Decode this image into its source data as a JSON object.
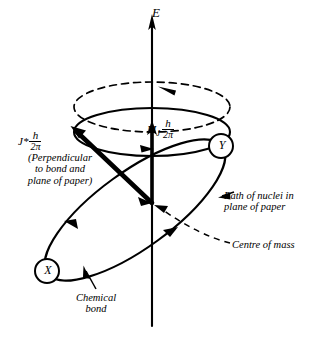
{
  "figure": {
    "type": "scientific-line-diagram",
    "background_color": "#ffffff",
    "ink_color": "#000000",
    "width": 316,
    "height": 340
  },
  "axis": {
    "label": "E",
    "name": "energy-field-axis",
    "orientation": "vertical",
    "arrow_at": "top",
    "x": 152,
    "top_y": 18,
    "bottom_y": 326
  },
  "vectors": {
    "total_angular_momentum": {
      "symbol": "J*",
      "numerator": "h",
      "denominator": "2π",
      "note": "(Perpendicular to bond and plane of paper)",
      "note_lines": [
        "(Perpendicular",
        "to bond and",
        "plane of paper)"
      ],
      "from": [
        152,
        203
      ],
      "to": [
        72,
        128
      ],
      "style": "thick-solid-arrow"
    },
    "projection": {
      "symbol": "M",
      "subscript": "J",
      "numerator": "h",
      "denominator": "2π",
      "from": [
        152,
        203
      ],
      "to": [
        152,
        124
      ],
      "style": "thick-solid-arrow"
    }
  },
  "precession": {
    "dashed_circle_label": "precession-path",
    "center": [
      152,
      107
    ],
    "rx": 78,
    "ry": 25,
    "arrow_direction": "counterclockwise",
    "cone_base_label": "cone-base-ellipse",
    "cone_base_center": [
      152,
      132
    ],
    "cone_base_rx": 78,
    "cone_base_ry": 24
  },
  "orbit": {
    "label": "Path of nuclei in plane of paper",
    "label_lines": [
      "Path of nuclei in",
      "plane of paper"
    ],
    "tilt_deg": -36,
    "center": [
      135,
      210
    ],
    "rx": 108,
    "ry": 38,
    "arrows": 3
  },
  "nuclei": [
    {
      "name": "nucleus-x",
      "letter": "X",
      "cx": 47,
      "cy": 271,
      "r": 12
    },
    {
      "name": "nucleus-y",
      "letter": "Y",
      "cx": 221,
      "cy": 146,
      "r": 12
    }
  ],
  "annotations": {
    "centre_of_mass": {
      "text": "Centre of mass",
      "leader": "dashed",
      "points_to": [
        152,
        203
      ]
    },
    "chemical_bond": {
      "text": "Chemical bond",
      "text_lines": [
        "Chemical",
        "bond"
      ],
      "leader": "solid",
      "points_to": [
        88,
        268
      ]
    },
    "vertical_dashed_drop": {
      "from": [
        152,
        205
      ],
      "to": [
        152,
        258
      ]
    }
  }
}
